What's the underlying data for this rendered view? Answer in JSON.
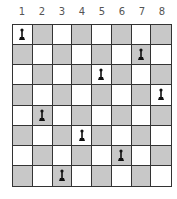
{
  "columns": [
    "1",
    "2",
    "3",
    "4",
    "5",
    "6",
    "7",
    "8"
  ],
  "colors": {
    "light": "#ffffff",
    "dark": "#c8c8c8",
    "grid": "#333333",
    "piece": "#111111"
  },
  "pieces": [
    {
      "row": 1,
      "col": 1,
      "type": "pawn"
    },
    {
      "row": 2,
      "col": 7,
      "type": "pawn"
    },
    {
      "row": 3,
      "col": 5,
      "type": "pawn"
    },
    {
      "row": 4,
      "col": 8,
      "type": "pawn"
    },
    {
      "row": 5,
      "col": 2,
      "type": "pawn"
    },
    {
      "row": 6,
      "col": 4,
      "type": "pawn"
    },
    {
      "row": 7,
      "col": 6,
      "type": "pawn"
    },
    {
      "row": 8,
      "col": 3,
      "type": "pawn"
    }
  ]
}
